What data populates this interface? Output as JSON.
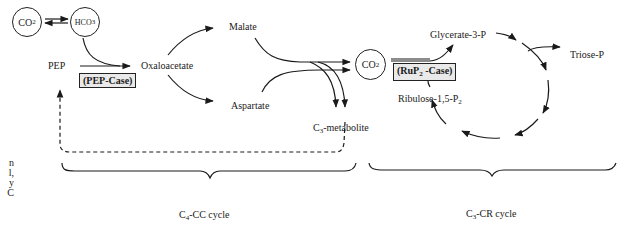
{
  "diagram": {
    "type": "metabolic pathway diagram",
    "left_cut_text_fragments": [
      "n",
      "l,",
      "y",
      "C"
    ],
    "c4_cycle": {
      "co2_circle": {
        "base": "CO",
        "sub": "2"
      },
      "hco3_circle": {
        "base": "HCO",
        "sub": "3"
      },
      "pep": "PEP",
      "pep_case": "(PEP-Case)",
      "oxaloacetate": "Oxaloacetate",
      "malate": "Malate",
      "aspartate": "Aspartate",
      "c3_metabolite": {
        "base": "C",
        "sub": "3",
        "rest": "-metabolite"
      },
      "label": {
        "base": "C",
        "sub": "4",
        "rest": "-CC cycle"
      }
    },
    "c3_cycle": {
      "co2_circle": {
        "base": "CO",
        "sub": "2"
      },
      "rup2_case": {
        "pre": "(RuP",
        "sub": "2",
        "post": " -Case)"
      },
      "glycerate": "Glycerate-3-P",
      "triose": "Triose-P",
      "ribulose": {
        "base": "Ribulose-1,5-P",
        "sub": "2"
      },
      "label": {
        "base": "C",
        "sub": "3",
        "rest": "-CR cycle"
      }
    }
  }
}
